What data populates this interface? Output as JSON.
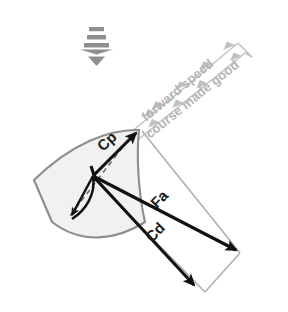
{
  "diagram": {
    "background_color": "#ffffff",
    "labels": {
      "forward_speed": "forward speed",
      "course_made_good": "course made good",
      "cp": "Cp",
      "fa": "Fa",
      "cd": "Cd"
    },
    "colors": {
      "sail_fill": "#f1f1f1",
      "sail_outline": "#8d8d8d",
      "vector_black": "#111111",
      "frame_gray": "#adadad",
      "flow_gray": "#c2c2c2",
      "label_gray": "#b4b4b4",
      "label_black": "#1a1a1a",
      "wind_symbol": "#8f8f8f"
    },
    "wind_symbol": {
      "name": "wind-direction-down-arrow",
      "bars": 3,
      "direction": "down"
    },
    "vectors": [
      {
        "id": "cp",
        "label": "Cp",
        "style": "black",
        "origin": [
          93,
          176
        ],
        "tip": [
          139,
          130
        ]
      },
      {
        "id": "fa",
        "label": "Fa",
        "style": "black",
        "origin": [
          93,
          176
        ],
        "tip": [
          240,
          253
        ]
      },
      {
        "id": "cd",
        "label": "Cd",
        "style": "black",
        "origin": [
          93,
          176
        ],
        "tip": [
          197,
          289
        ]
      },
      {
        "id": "heel",
        "label": "",
        "style": "black",
        "origin": [
          93,
          176
        ],
        "tip": [
          70,
          219
        ]
      }
    ],
    "flow_lines": [
      {
        "id": "forward-speed",
        "label": "forward speed",
        "from": [
          131,
          132
        ],
        "to": [
          239,
          42
        ]
      },
      {
        "id": "course-made-good",
        "label": "course made good",
        "from": [
          135,
          141
        ],
        "to": [
          246,
          52
        ]
      }
    ]
  }
}
